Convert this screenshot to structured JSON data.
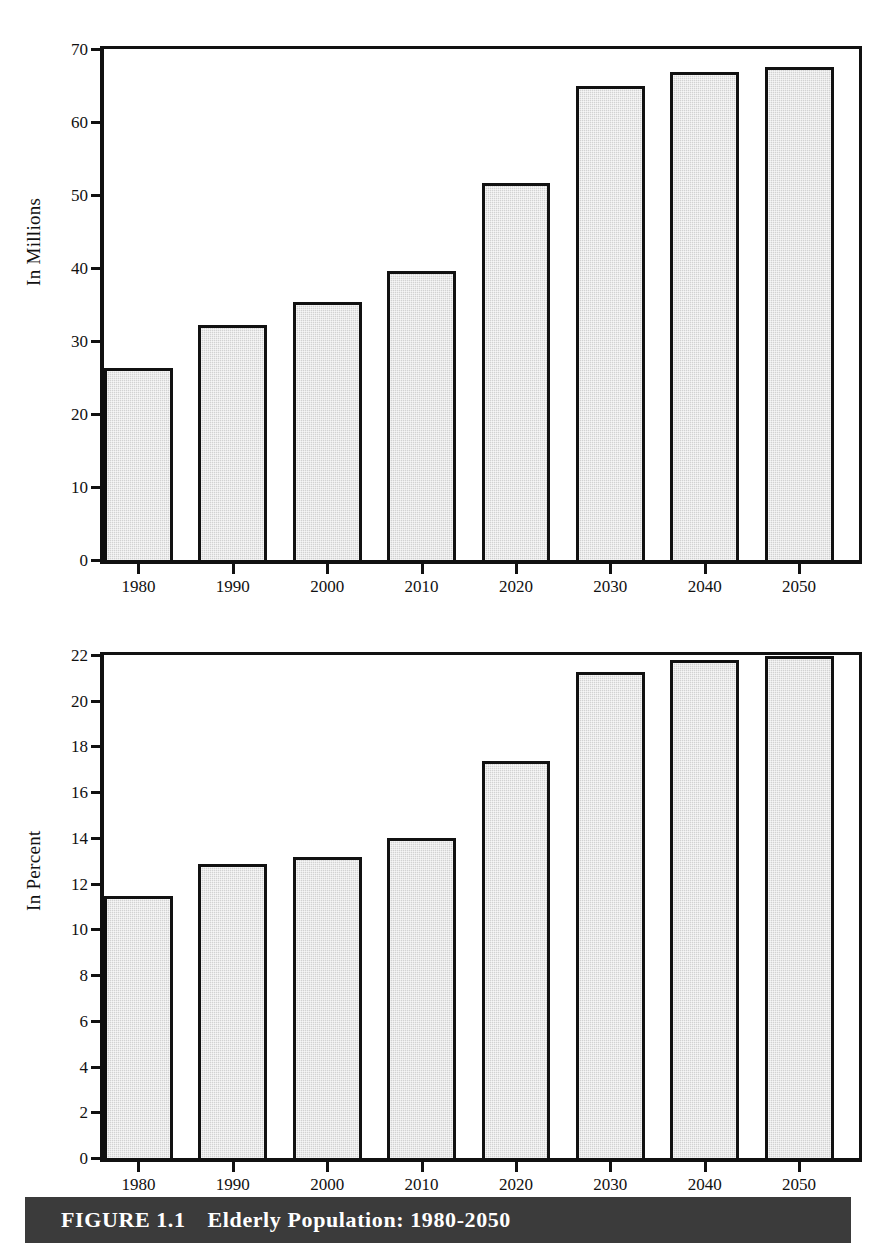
{
  "caption": {
    "label": "FIGURE 1.1",
    "title": "Elderly Population: 1980-2050",
    "bar_color": "#3b3b3b",
    "text_color": "#ffffff"
  },
  "style": {
    "bar_fill": "#d2d2d2",
    "bar_stroke": "#111111",
    "background": "#ffffff"
  },
  "chart_data": [
    {
      "type": "bar",
      "title": "",
      "panel": "top",
      "xlabel": "",
      "ylabel": "In Millions",
      "categories": [
        "1980",
        "1990",
        "2000",
        "2010",
        "2020",
        "2030",
        "2040",
        "2050"
      ],
      "values": [
        25.8,
        31.6,
        34.8,
        39.0,
        51.1,
        64.4,
        66.3,
        67.0
      ],
      "ylim": [
        0,
        70
      ],
      "ytick_step": 10,
      "yticks": [
        0,
        10,
        20,
        30,
        40,
        50,
        60,
        70
      ],
      "ytick_labels": [
        "0",
        "10",
        "20",
        "30",
        "40",
        "50",
        "60",
        "70"
      ],
      "grid": false,
      "legend": false
    },
    {
      "type": "bar",
      "title": "",
      "panel": "bottom",
      "xlabel": "",
      "ylabel": "In Percent",
      "categories": [
        "1980",
        "1990",
        "2000",
        "2010",
        "2020",
        "2030",
        "2040",
        "2050"
      ],
      "values": [
        11.3,
        12.7,
        13.0,
        13.8,
        17.2,
        21.1,
        21.6,
        21.8
      ],
      "ylim": [
        0,
        22
      ],
      "ytick_step": 2,
      "yticks": [
        0,
        2,
        4,
        6,
        8,
        10,
        12,
        14,
        16,
        18,
        20,
        22
      ],
      "ytick_labels": [
        "0",
        "2",
        "4",
        "6",
        "8",
        "10",
        "12",
        "14",
        "16",
        "18",
        "20",
        "22"
      ],
      "grid": false,
      "legend": false
    }
  ]
}
